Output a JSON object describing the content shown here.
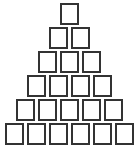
{
  "diagram": {
    "type": "box-pyramid",
    "rows": [
      1,
      2,
      3,
      4,
      5,
      6
    ],
    "total_boxes": 21,
    "box_border_color": "#333333",
    "background_color": "#ffffff"
  }
}
